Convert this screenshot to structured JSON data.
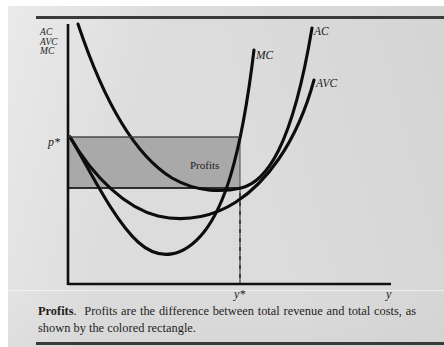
{
  "figure": {
    "axes": {
      "y_axis_legend": [
        "AC",
        "AVC",
        "MC"
      ],
      "y_axis_name": "y",
      "price_label": "p*",
      "quantity_label": "y*"
    },
    "curves": [
      {
        "id": "mc",
        "label": "MC",
        "name": "marginal-cost-curve"
      },
      {
        "id": "ac",
        "label": "AC",
        "name": "average-cost-curve"
      },
      {
        "id": "avc",
        "label": "AVC",
        "name": "average-variable-cost-curve"
      }
    ],
    "regions": [
      {
        "id": "profits",
        "label": "Profits",
        "fill": "#a9a9a9"
      },
      {
        "id": "total-cost",
        "label": "",
        "fill": "none"
      }
    ],
    "colors": {
      "paper": "#dcdcdc",
      "ink": "#101010",
      "profit_fill": "#a9a9a9",
      "rule": "#3a3a3a"
    }
  },
  "caption": {
    "title": "Profits",
    "separator": ".",
    "text": "Profits are the difference between total revenue and total costs, as shown by the colored rectangle."
  }
}
